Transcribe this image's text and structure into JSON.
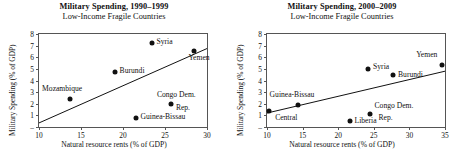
{
  "figure": {
    "xlabel": "Natural resource rents (% of GDP)",
    "ylabel": "Military Spending (% of GDP)"
  },
  "chart_data": [
    {
      "type": "scatter",
      "title": "Military Spending, 1990–1999",
      "subtitle": "Low-Income Fragile Countries",
      "xlabel": "Natural resource rents (% of GDP)",
      "ylabel": "Military Spending (% of GDP)",
      "xlim": [
        10,
        30
      ],
      "ylim": [
        0,
        8
      ],
      "xticks": [
        10,
        15,
        20,
        25,
        30
      ],
      "yticks": [
        0,
        1,
        2,
        3,
        4,
        5,
        6,
        7,
        8
      ],
      "ytick_labels": [
        "–",
        "1",
        "2",
        "3",
        "4",
        "5",
        "6",
        "7",
        "8"
      ],
      "grid": false,
      "legend": "none",
      "trendline": {
        "x0": 10,
        "y0": 0.35,
        "x1": 30,
        "y1": 6.75
      },
      "points": [
        {
          "label": "Mozambique",
          "x": 13.7,
          "y": 2.4,
          "label_dx": -28,
          "label_dy": -9,
          "align": "left"
        },
        {
          "label": "Burundi",
          "x": 19.0,
          "y": 4.7,
          "label_dx": 5,
          "label_dy": 0,
          "align": "left"
        },
        {
          "label": "Syria",
          "x": 23.4,
          "y": 7.2,
          "label_dx": 5,
          "label_dy": 0,
          "align": "left"
        },
        {
          "label": "Yemen",
          "x": 28.5,
          "y": 6.5,
          "label_dx": -6,
          "label_dy": 8,
          "align": "left"
        },
        {
          "label": "Congo Dem.",
          "x": 25.7,
          "y": 1.95,
          "label_dx": -14,
          "label_dy": -8,
          "align": "left"
        },
        {
          "label": "Rep.",
          "x": 25.7,
          "y": 1.95,
          "label_dx": 5,
          "label_dy": 5,
          "align": "left",
          "marker": false
        },
        {
          "label": "Guinea-Bissau",
          "x": 21.5,
          "y": 0.75,
          "label_dx": 5,
          "label_dy": 0,
          "align": "left"
        }
      ]
    },
    {
      "type": "scatter",
      "title": "Military Spending, 2000–2009",
      "subtitle": "Low-Income Fragile Countries",
      "xlabel": "Natural resource rents (% of GDP)",
      "ylabel": "Military Spending (% of GDP)",
      "xlim": [
        10,
        35
      ],
      "ylim": [
        0,
        8
      ],
      "xticks": [
        10,
        15,
        20,
        25,
        30,
        35
      ],
      "yticks": [
        0,
        1,
        2,
        3,
        4,
        5,
        6,
        7,
        8
      ],
      "ytick_labels": [
        "–",
        "1",
        "2",
        "3",
        "4",
        "5",
        "6",
        "7",
        "8"
      ],
      "grid": false,
      "legend": "none",
      "trendline": {
        "x0": 10,
        "y0": 1.2,
        "x1": 35,
        "y1": 4.8
      },
      "points": [
        {
          "label": "Central",
          "x": 10.3,
          "y": 1.4,
          "label_dx": 6,
          "label_dy": 8,
          "align": "left"
        },
        {
          "label": "Guinea-Bissau",
          "x": 14.3,
          "y": 1.9,
          "label_dx": -28,
          "label_dy": -9,
          "align": "left"
        },
        {
          "label": "Syria",
          "x": 24.2,
          "y": 4.95,
          "label_dx": 5,
          "label_dy": -1,
          "align": "left"
        },
        {
          "label": "Burundi",
          "x": 27.7,
          "y": 4.45,
          "label_dx": 5,
          "label_dy": 1,
          "align": "left"
        },
        {
          "label": "Yemen",
          "x": 34.6,
          "y": 5.35,
          "label_dx": -26,
          "label_dy": -9,
          "align": "left"
        },
        {
          "label": "Congo Dem.",
          "x": 24.4,
          "y": 1.1,
          "label_dx": 5,
          "label_dy": -7,
          "align": "left"
        },
        {
          "label": "Rep.",
          "x": 24.4,
          "y": 1.1,
          "label_dx": 9,
          "label_dy": 5,
          "align": "left",
          "marker": false
        },
        {
          "label": "Liberia",
          "x": 21.6,
          "y": 0.5,
          "label_dx": 5,
          "label_dy": 1,
          "align": "left"
        }
      ]
    }
  ]
}
